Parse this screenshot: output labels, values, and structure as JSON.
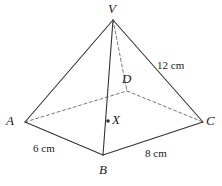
{
  "figure": {
    "canvas": {
      "width": 222,
      "height": 186
    },
    "stroke_color": "#333333",
    "dash_color": "#555555",
    "background": "#ffffff"
  },
  "vertices": [
    {
      "id": "V",
      "label": "V",
      "x": 113,
      "y": 20,
      "label_x": 108,
      "label_y": 2,
      "kind": "apex"
    },
    {
      "id": "A",
      "label": "A",
      "x": 25,
      "y": 122,
      "label_x": 6,
      "label_y": 114,
      "kind": "base"
    },
    {
      "id": "B",
      "label": "B",
      "x": 103,
      "y": 155,
      "label_x": 99,
      "label_y": 163,
      "kind": "base"
    },
    {
      "id": "C",
      "label": "C",
      "x": 203,
      "y": 122,
      "label_x": 206,
      "label_y": 114,
      "kind": "base"
    },
    {
      "id": "D",
      "label": "D",
      "x": 127,
      "y": 91,
      "label_x": 122,
      "label_y": 72,
      "kind": "base-hidden"
    }
  ],
  "center_point": {
    "id": "X",
    "label": "X",
    "dot_x": 108,
    "dot_y": 121,
    "label_x": 112,
    "label_y": 113,
    "dot_radius": 1.8
  },
  "edges": [
    {
      "from": "V",
      "to": "A",
      "style": "solid",
      "name": "edge-VA"
    },
    {
      "from": "V",
      "to": "B",
      "style": "solid",
      "name": "edge-VB"
    },
    {
      "from": "V",
      "to": "C",
      "style": "solid",
      "name": "edge-VC"
    },
    {
      "from": "V",
      "to": "D",
      "style": "dashed",
      "name": "edge-VD"
    },
    {
      "from": "A",
      "to": "B",
      "style": "solid",
      "name": "edge-AB"
    },
    {
      "from": "B",
      "to": "C",
      "style": "solid",
      "name": "edge-BC"
    },
    {
      "from": "A",
      "to": "D",
      "style": "dashed",
      "name": "edge-AD"
    },
    {
      "from": "D",
      "to": "C",
      "style": "dashed",
      "name": "edge-DC"
    }
  ],
  "measurements": [
    {
      "id": "m-AB",
      "text": "6 cm",
      "edge": "A-B",
      "label_x": 33,
      "label_y": 143
    },
    {
      "id": "m-BC",
      "text": "8 cm",
      "edge": "B-C",
      "label_x": 145,
      "label_y": 148
    },
    {
      "id": "m-VC",
      "text": "12 cm",
      "edge": "V-C",
      "label_x": 157,
      "label_y": 60
    }
  ]
}
